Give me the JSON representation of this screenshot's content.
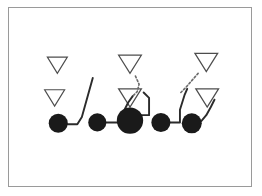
{
  "figure": {
    "kind": "football-play-diagram",
    "background_color": "#ffffff",
    "frame": {
      "border_color": "#9a9a9a",
      "border_width": 1,
      "x": 8,
      "y": 7,
      "width": 244,
      "height": 180
    },
    "ink_color": "#1a1a1a",
    "outline_color": "#4d4d4d",
    "line_color": "#2b2b2b"
  },
  "legend_semantics": {
    "filled_circle": "offensive player",
    "open_triangle": "defensive player",
    "solid_line": "blocking or movement path",
    "dotted_line": "coverage or assignment"
  },
  "offense": {
    "label": "offensive line",
    "players": [
      {
        "name": "left-guard",
        "cx": 52,
        "cy": 127,
        "r": 10.5
      },
      {
        "name": "left-tackle",
        "cx": 95,
        "cy": 126,
        "r": 10.0
      },
      {
        "name": "center",
        "cx": 131,
        "cy": 124,
        "r": 14.5
      },
      {
        "name": "right-guard",
        "cx": 165,
        "cy": 126,
        "r": 10.5
      },
      {
        "name": "right-tackle",
        "cx": 199,
        "cy": 127,
        "r": 11.0
      }
    ]
  },
  "defense": {
    "label": "defenders",
    "players": [
      {
        "name": "defender-outside-left",
        "cx": 51,
        "cy": 63,
        "w": 22,
        "h": 18
      },
      {
        "name": "defender-inside-left",
        "cx": 48,
        "cy": 99,
        "w": 22,
        "h": 18
      },
      {
        "name": "defender-deep-middle",
        "cx": 131,
        "cy": 62,
        "w": 25,
        "h": 20
      },
      {
        "name": "defender-near-middle",
        "cx": 131,
        "cy": 99,
        "w": 25,
        "h": 20
      },
      {
        "name": "defender-deep-right",
        "cx": 215,
        "cy": 60,
        "w": 25,
        "h": 20
      },
      {
        "name": "defender-near-right",
        "cx": 216,
        "cy": 99,
        "w": 25,
        "h": 20
      }
    ]
  },
  "routes": {
    "solid_paths": [
      {
        "name": "left-guard-path",
        "points": "62,128 73,128 78,120 90,77"
      },
      {
        "name": "left-tackle-path",
        "points": "105,126 118,126"
      },
      {
        "name": "center-left-path",
        "points": "118,126 124,114 129,104 134,97"
      },
      {
        "name": "center-hook-path",
        "points": "143,118 152,118 152,99 146,93"
      },
      {
        "name": "right-guard-path",
        "points": "175,126 186,126 186,112 191,96 194,89"
      },
      {
        "name": "right-tackle-path",
        "points": "209,125 215,118 220,109 224,101"
      }
    ],
    "dotted_paths": [
      {
        "name": "middle-coverage-link",
        "points": "137,75 141,84 139,92 134,97"
      },
      {
        "name": "right-coverage-link",
        "points": "206,72 199,80 192,88 187,93"
      }
    ]
  }
}
